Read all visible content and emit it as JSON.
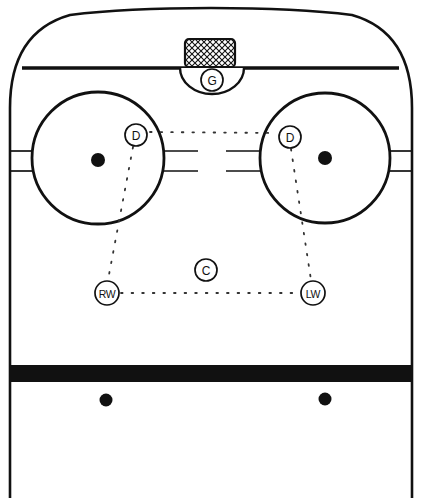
{
  "diagram": {
    "type": "ice-hockey-rink-half",
    "colors": {
      "ice": "#ffffff",
      "lines": "#111111",
      "goal_line": "#111111",
      "blue_line": "#111111",
      "faceoff_dot": "#111111",
      "net_hatch": "#111111"
    }
  },
  "players": [
    {
      "id": "goalie",
      "label": "G",
      "position_name": "Goaltender",
      "x": 212,
      "y": 80,
      "radius": 11
    },
    {
      "id": "defense-left",
      "label": "D",
      "position_name": "Defense",
      "x": 136,
      "y": 135,
      "radius": 11
    },
    {
      "id": "defense-right",
      "label": "D",
      "position_name": "Defense",
      "x": 290,
      "y": 137,
      "radius": 11
    },
    {
      "id": "center",
      "label": "C",
      "position_name": "Center",
      "x": 206,
      "y": 270,
      "radius": 11
    },
    {
      "id": "right-wing",
      "label": "RW",
      "position_name": "Right Wing",
      "x": 107,
      "y": 293,
      "radius": 12
    },
    {
      "id": "left-wing",
      "label": "LW",
      "position_name": "Left Wing",
      "x": 313,
      "y": 293,
      "radius": 12
    }
  ],
  "rink_features": {
    "boards_label": "Rink Boards",
    "goal_line_label": "Goal Line",
    "blue_line_label": "Blue Line",
    "crease_label": "Goal Crease",
    "net_label": "Net",
    "faceoff_circles": [
      {
        "id": "faceoff-circle-left",
        "cx": 98,
        "cy": 158,
        "r": 66
      },
      {
        "id": "faceoff-circle-right",
        "cx": 325,
        "cy": 158,
        "r": 65
      }
    ],
    "faceoff_dots": [
      {
        "id": "faceoff-dot-left",
        "cx": 98,
        "cy": 160,
        "r": 7
      },
      {
        "id": "faceoff-dot-right",
        "cx": 325,
        "cy": 158,
        "r": 7
      },
      {
        "id": "neutral-dot-left",
        "cx": 106,
        "cy": 400,
        "r": 6.5
      },
      {
        "id": "neutral-dot-right",
        "cx": 325,
        "cy": 399,
        "r": 6.5
      }
    ]
  },
  "coverage_links": [
    {
      "id": "link-d-to-d",
      "from": "defense-left",
      "to": "defense-right"
    },
    {
      "id": "link-d-to-rw",
      "from": "defense-left",
      "to": "right-wing"
    },
    {
      "id": "link-d-to-lw",
      "from": "defense-right",
      "to": "left-wing"
    },
    {
      "id": "link-rw-to-lw",
      "from": "right-wing",
      "to": "left-wing"
    }
  ]
}
